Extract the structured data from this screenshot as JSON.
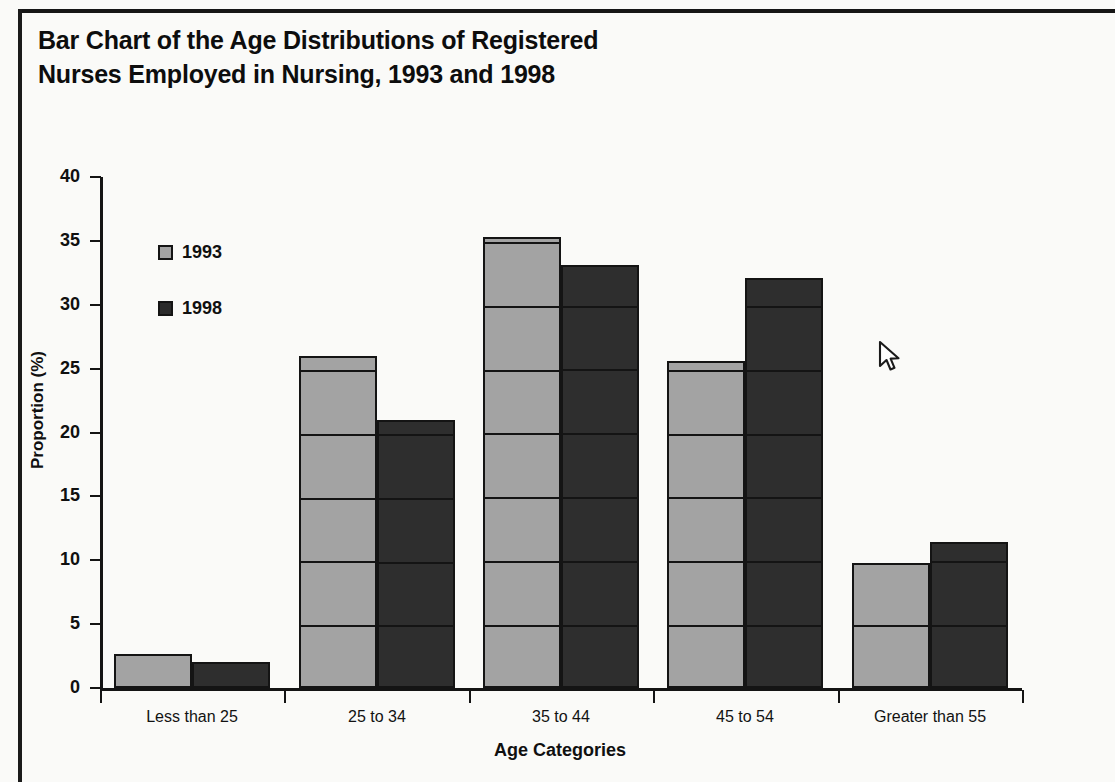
{
  "chart_data": {
    "type": "bar",
    "title": "Bar Chart of the Age Distributions of Registered Nurses Employed in Nursing, 1993 and 1998",
    "xlabel": "Age Categories",
    "ylabel": "Proportion (%)",
    "categories": [
      "Less than 25",
      "25 to 34",
      "35 to 44",
      "45 to 54",
      "Greater than 55"
    ],
    "series": [
      {
        "name": "1993",
        "color": "#a3a3a3",
        "values": [
          2.7,
          26.0,
          35.3,
          25.6,
          9.8
        ]
      },
      {
        "name": "1998",
        "color": "#2e2e2e",
        "values": [
          2.0,
          21.0,
          33.1,
          32.1,
          11.4
        ]
      }
    ],
    "ylim": [
      0,
      40
    ],
    "yticks": [
      0,
      5,
      10,
      15,
      20,
      25,
      30,
      35,
      40
    ],
    "ytick_labels": [
      "0",
      "5",
      "10",
      "15",
      "20",
      "25",
      "30",
      "35",
      "40"
    ],
    "grid": "horizontal-over-bars",
    "legend_position": "upper-left-inside"
  },
  "legend": {
    "entries": [
      {
        "label": "1993"
      },
      {
        "label": "1998"
      }
    ]
  },
  "cursor": {
    "icon": "arrow-pointer-icon",
    "x": 883,
    "y": 353
  }
}
